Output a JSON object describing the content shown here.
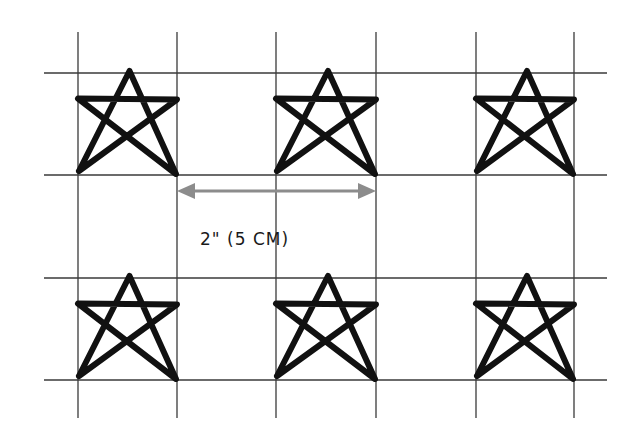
{
  "diagram": {
    "measurement_label": "2\" (5 CM)",
    "colors": {
      "background": "#ffffff",
      "grid_line": "#3a3a3a",
      "star_stroke": "#111111",
      "arrow": "#8c8c8c",
      "text": "#1a1a1a"
    },
    "grid": {
      "vertical_lines_x": [
        78,
        177,
        276,
        376,
        476,
        574
      ],
      "vertical_span_y": [
        32,
        418
      ],
      "horizontal_lines_y": [
        73,
        175,
        278,
        380
      ],
      "horizontal_span_x": [
        44,
        607
      ]
    },
    "stars": [
      {
        "row": 1,
        "col": 1,
        "box": [
          78,
          73,
          177,
          175
        ]
      },
      {
        "row": 1,
        "col": 2,
        "box": [
          276,
          73,
          376,
          175
        ]
      },
      {
        "row": 1,
        "col": 3,
        "box": [
          476,
          73,
          574,
          175
        ]
      },
      {
        "row": 2,
        "col": 1,
        "box": [
          78,
          278,
          177,
          380
        ]
      },
      {
        "row": 2,
        "col": 2,
        "box": [
          276,
          278,
          376,
          380
        ]
      },
      {
        "row": 2,
        "col": 3,
        "box": [
          476,
          278,
          574,
          380
        ]
      }
    ],
    "arrow": {
      "x1": 177,
      "x2": 376,
      "y": 191,
      "style": "double-headed"
    }
  }
}
